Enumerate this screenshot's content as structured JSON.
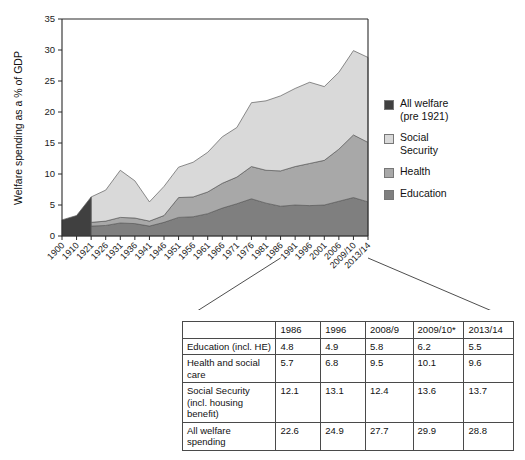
{
  "chart_data": {
    "type": "area",
    "title": "",
    "xlabel": "",
    "ylabel": "Welfare spending as a % of GDP",
    "ylim": [
      0,
      35
    ],
    "ytick_values": [
      0,
      5,
      10,
      15,
      20,
      25,
      30,
      35
    ],
    "grid": false,
    "legend_position": "right",
    "stacked": true,
    "categories": [
      "1900",
      "1910",
      "1921",
      "1926",
      "1931",
      "1936",
      "1941",
      "1946",
      "1951",
      "1956",
      "1961",
      "1966",
      "1971",
      "1976",
      "1981",
      "1986",
      "1991",
      "1996",
      "2001",
      "2006",
      "2009/10",
      "2013/14"
    ],
    "series": [
      {
        "name": "All welfare (pre 1921)",
        "color": "#404040",
        "values": [
          2.6,
          3.3,
          6.3,
          null,
          null,
          null,
          null,
          null,
          null,
          null,
          null,
          null,
          null,
          null,
          null,
          null,
          null,
          null,
          null,
          null,
          null,
          null
        ]
      },
      {
        "name": "Education",
        "color": "#7f7f7f",
        "values": [
          null,
          null,
          1.6,
          1.7,
          2.1,
          2.0,
          1.6,
          2.2,
          3.0,
          3.1,
          3.6,
          4.5,
          5.2,
          6.0,
          5.3,
          4.8,
          5.0,
          4.9,
          5.0,
          5.6,
          6.2,
          5.5
        ]
      },
      {
        "name": "Health",
        "color": "#a8a8a8",
        "values": [
          null,
          null,
          0.6,
          0.7,
          0.9,
          0.9,
          0.8,
          1.1,
          3.2,
          3.2,
          3.5,
          4.0,
          4.3,
          5.2,
          5.3,
          5.7,
          6.2,
          6.8,
          7.2,
          8.4,
          10.1,
          9.6
        ]
      },
      {
        "name": "Social Security",
        "color": "#d9d9d9",
        "values": [
          null,
          null,
          4.1,
          5.0,
          7.6,
          6.0,
          3.1,
          4.7,
          4.9,
          5.6,
          6.4,
          7.5,
          8.0,
          10.3,
          11.2,
          12.1,
          12.6,
          13.1,
          11.9,
          12.4,
          13.6,
          13.7
        ]
      }
    ],
    "totals": [
      2.6,
      3.3,
      12.6,
      7.4,
      10.6,
      8.9,
      5.5,
      8.0,
      11.1,
      11.9,
      13.5,
      16.0,
      17.5,
      21.5,
      21.8,
      22.6,
      23.8,
      24.8,
      24.1,
      26.4,
      29.9,
      28.8
    ]
  },
  "legend": {
    "items": [
      {
        "label": "All welfare\n(pre 1921)",
        "color": "#404040"
      },
      {
        "label": "Social\nSecurity",
        "color": "#d9d9d9"
      },
      {
        "label": "Health",
        "color": "#a8a8a8"
      },
      {
        "label": "Education",
        "color": "#7f7f7f"
      }
    ]
  },
  "table": {
    "corner": "",
    "headers": [
      "1986",
      "1996",
      "2008/9",
      "2009/10*",
      "2013/14"
    ],
    "rows": [
      {
        "label": "Education (incl. HE)",
        "values": [
          "4.8",
          "4.9",
          "5.8",
          "6.2",
          "5.5"
        ]
      },
      {
        "label": "Health and social care",
        "values": [
          "5.7",
          "6.8",
          "9.5",
          "10.1",
          "9.6"
        ]
      },
      {
        "label": "Social Security (incl. housing benefit)",
        "values": [
          "12.1",
          "13.1",
          "12.4",
          "13.6",
          "13.7"
        ]
      },
      {
        "label": "All welfare spending",
        "values": [
          "22.6",
          "24.9",
          "27.7",
          "29.9",
          "28.8"
        ]
      }
    ]
  }
}
